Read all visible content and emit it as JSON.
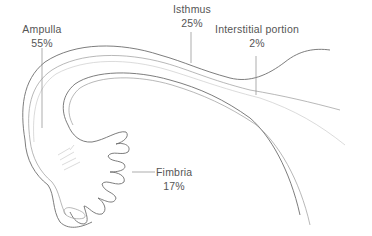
{
  "diagram": {
    "line_color": "#6e6e6e",
    "text_color": "#555555",
    "labels": [
      {
        "name": "Ampulla",
        "percent": "55%"
      },
      {
        "name": "Isthmus",
        "percent": "25%"
      },
      {
        "name": "Interstitial portion",
        "percent": "2%"
      },
      {
        "name": "Fimbria",
        "percent": "17%"
      }
    ]
  }
}
